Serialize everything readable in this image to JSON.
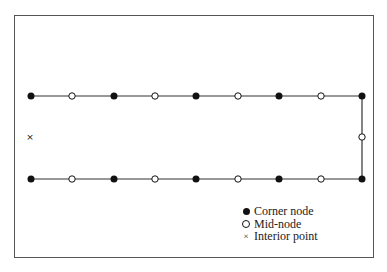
{
  "diagram": {
    "type": "boundary-element-mesh",
    "colors": {
      "line": "#333333",
      "node": "#111111",
      "frame": "#555555"
    },
    "top_edge_y": 96,
    "bottom_edge_y": 179,
    "right_edge_x": 362,
    "top_nodes": [
      {
        "x": 31,
        "kind": "corner"
      },
      {
        "x": 72,
        "kind": "mid"
      },
      {
        "x": 114,
        "kind": "corner"
      },
      {
        "x": 155,
        "kind": "mid"
      },
      {
        "x": 196,
        "kind": "corner"
      },
      {
        "x": 238,
        "kind": "mid"
      },
      {
        "x": 279,
        "kind": "corner"
      },
      {
        "x": 321,
        "kind": "mid"
      },
      {
        "x": 362,
        "kind": "corner"
      }
    ],
    "bottom_nodes": [
      {
        "x": 31,
        "kind": "corner"
      },
      {
        "x": 72,
        "kind": "mid"
      },
      {
        "x": 114,
        "kind": "corner"
      },
      {
        "x": 155,
        "kind": "mid"
      },
      {
        "x": 196,
        "kind": "corner"
      },
      {
        "x": 238,
        "kind": "mid"
      },
      {
        "x": 279,
        "kind": "corner"
      },
      {
        "x": 321,
        "kind": "mid"
      },
      {
        "x": 362,
        "kind": "corner"
      }
    ],
    "right_mid_node": {
      "x": 362,
      "y": 137,
      "kind": "mid"
    },
    "interior_point": {
      "x": 30,
      "y": 137,
      "symbol": "×"
    }
  },
  "legend": {
    "items": [
      {
        "symbol": "filled-circle",
        "label": "Corner node"
      },
      {
        "symbol": "open-circle",
        "label": "Mid-node"
      },
      {
        "symbol": "×",
        "label": "Interior point"
      }
    ]
  }
}
